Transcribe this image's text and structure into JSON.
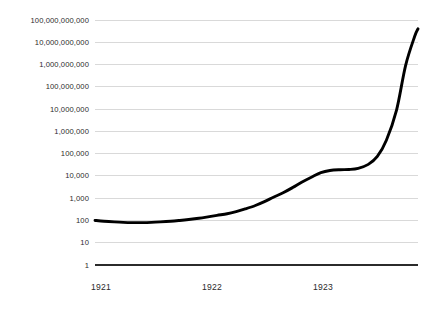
{
  "chart_data": {
    "type": "line",
    "title": "",
    "subtitle": "",
    "xlabel": "",
    "ylabel": "",
    "yscale": "log",
    "ylim": [
      1,
      100000000000
    ],
    "xlim": [
      1921.0,
      1923.86
    ],
    "grid": true,
    "legend": null,
    "annotations": [],
    "ytick_values": [
      100000000000,
      10000000000,
      1000000000,
      100000000,
      10000000,
      1000000,
      100000,
      10000,
      1000,
      100,
      10,
      1
    ],
    "ytick_labels": [
      "100,000,000,000",
      "10,000,000,000",
      "1,000,000,000",
      "100,000,000",
      "10,000,000",
      "1,000,000",
      "100,000",
      "10,000",
      "1,000",
      "100",
      "10",
      "1"
    ],
    "xtick_values": [
      1921,
      1922,
      1923
    ],
    "xtick_labels": [
      "1921",
      "1922",
      "1923"
    ],
    "series": [
      {
        "name": "Price index",
        "color": "#000000",
        "x": [
          1921.0,
          1921.08,
          1921.17,
          1921.25,
          1921.33,
          1921.42,
          1921.5,
          1921.58,
          1921.67,
          1921.75,
          1921.83,
          1921.92,
          1922.0,
          1922.08,
          1922.17,
          1922.25,
          1922.33,
          1922.42,
          1922.5,
          1922.58,
          1922.67,
          1922.75,
          1922.83,
          1922.92,
          1923.0,
          1923.08,
          1923.17,
          1923.25,
          1923.33,
          1923.42,
          1923.5,
          1923.58,
          1923.67,
          1923.75,
          1923.83,
          1923.86
        ],
        "y": [
          100,
          92,
          86,
          82,
          80,
          80,
          82,
          86,
          92,
          100,
          110,
          125,
          145,
          170,
          200,
          250,
          330,
          470,
          700,
          1100,
          1800,
          3000,
          5200,
          9000,
          14000,
          17500,
          19000,
          19500,
          22000,
          33000,
          75000,
          400000,
          9000000,
          900000000,
          18000000000,
          40000000000
        ]
      }
    ]
  },
  "geometry": {
    "plot_left": 95,
    "plot_right": 418,
    "plot_top": 20,
    "plot_bottom": 265,
    "ytick_y": [
      20,
      42.27,
      64.55,
      86.82,
      109.09,
      131.36,
      153.64,
      175.91,
      198.18,
      220.45,
      242.73,
      265
    ],
    "xtick_x": [
      101,
      212,
      323
    ]
  },
  "colors": {
    "background": "#ffffff",
    "gridline": "#c9c9c9",
    "axis": "#2b2b2b",
    "series": "#000000",
    "tick_text": "#2b2b2b"
  }
}
